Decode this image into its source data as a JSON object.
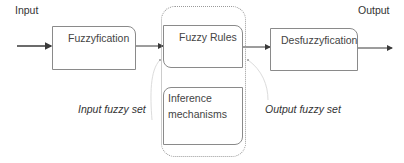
{
  "diagram": {
    "input_label": "Input",
    "output_label": "Output",
    "blocks": {
      "fuzzification": "Fuzzyfication",
      "fuzzy_rules": "Fuzzy Rules",
      "inference_line1": "Inference",
      "inference_line2": "mechanisms",
      "defuzzification": "Desfuzzyfication"
    },
    "annotations": {
      "input_fuzzy_set": "Input fuzzy set",
      "output_fuzzy_set": "Output fuzzy set"
    },
    "colors": {
      "line": "#3a3a3a",
      "box_border": "#8a8a8a",
      "container_border": "#9a9a9a",
      "curve": "#d8d8d8"
    }
  }
}
